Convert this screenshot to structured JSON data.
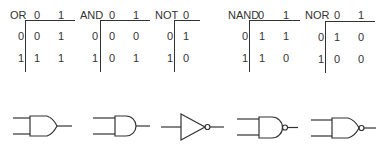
{
  "truth_tables": [
    {
      "name": "OR",
      "inputs": [
        "0",
        "1"
      ],
      "col_headers": [
        "0",
        "1"
      ],
      "rows": [
        {
          "label": "0",
          "values": [
            "0",
            "1"
          ]
        },
        {
          "label": "1",
          "values": [
            "1",
            "1"
          ]
        }
      ]
    },
    {
      "name": "AND",
      "inputs": [
        "0",
        "1"
      ],
      "col_headers": [
        "0",
        "1"
      ],
      "rows": [
        {
          "label": "0",
          "values": [
            "0",
            "0"
          ]
        },
        {
          "label": "1",
          "values": [
            "0",
            "1"
          ]
        }
      ]
    },
    {
      "name": "NOT",
      "col_headers": [
        "0"
      ],
      "rows": [
        {
          "label": "0",
          "values": [
            "1"
          ]
        },
        {
          "label": "1",
          "values": [
            "0"
          ]
        }
      ]
    },
    {
      "name": "NAND",
      "col_headers": [
        "0",
        "1"
      ],
      "rows": [
        {
          "label": "0",
          "values": [
            "1",
            "1"
          ]
        },
        {
          "label": "1",
          "values": [
            "1",
            "0"
          ]
        }
      ]
    },
    {
      "name": "NOR",
      "col_headers": [
        "0",
        "1"
      ],
      "rows": [
        {
          "label": "0",
          "values": [
            "1",
            "0"
          ]
        },
        {
          "label": "1",
          "values": [
            "0",
            "0"
          ]
        }
      ]
    }
  ],
  "gate_symbols": [
    "OR",
    "AND",
    "NOT",
    "NAND",
    "NOR"
  ],
  "colors": {
    "stroke": "#333333",
    "background": "#ffffff"
  }
}
